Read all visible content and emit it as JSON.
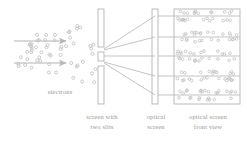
{
  "figure": {
    "background_color": "#ffffff",
    "stroke_color": "#b4b4b4",
    "dot_color": "#c2c2c2",
    "text_color": "#9a9a9a"
  },
  "labels": {
    "electrons": "electrons",
    "slit_screen_line1": "screen with",
    "slit_screen_line2": "two slits",
    "optical_screen_line1": "optical",
    "optical_screen_line2": "screen",
    "front_view_line1": "optical screen",
    "front_view_line2": "front view"
  },
  "beam": {
    "arrow_count": 2,
    "arrows": [
      {
        "x1": 14,
        "y1": 41,
        "x2": 66,
        "y2": 41
      },
      {
        "x1": 14,
        "y1": 63,
        "x2": 66,
        "y2": 63
      }
    ],
    "electron_dot_count": 58,
    "dot_radius": 1.5
  },
  "slit_screen": {
    "x": 98,
    "width": 6,
    "segments": [
      {
        "y": 9,
        "height": 38
      },
      {
        "y": 52,
        "height": 9
      },
      {
        "y": 66,
        "height": 38
      }
    ],
    "slit_gaps": [
      {
        "y": 47,
        "height": 5
      },
      {
        "y": 61,
        "height": 5
      }
    ]
  },
  "rays": {
    "count": 5,
    "origin_x": 104,
    "items": [
      {
        "origin_y": 49,
        "end_x": 155,
        "end_y": 16
      },
      {
        "origin_y": 50,
        "end_x": 155,
        "end_y": 37
      },
      {
        "origin_y": 56,
        "end_x": 155,
        "end_y": 56
      },
      {
        "origin_y": 62,
        "end_x": 155,
        "end_y": 76
      },
      {
        "origin_y": 63,
        "end_x": 155,
        "end_y": 95
      }
    ]
  },
  "optical_screen": {
    "x": 152,
    "y": 9,
    "width": 6,
    "height": 95
  },
  "front_view_panel": {
    "x": 174,
    "y": 9,
    "width": 66,
    "height": 95,
    "band_count": 5,
    "bands": [
      {
        "line_y": 16,
        "dots": 26
      },
      {
        "line_y": 37,
        "dots": 26
      },
      {
        "line_y": 56,
        "dots": 26
      },
      {
        "line_y": 76,
        "dots": 26
      },
      {
        "line_y": 95,
        "dots": 26
      }
    ],
    "connector_lines": [
      {
        "x1": 158,
        "y1": 16,
        "x2": 174,
        "y2": 16
      },
      {
        "x1": 158,
        "y1": 37,
        "x2": 174,
        "y2": 37
      },
      {
        "x1": 158,
        "y1": 56,
        "x2": 174,
        "y2": 56
      },
      {
        "x1": 158,
        "y1": 76,
        "x2": 174,
        "y2": 76
      },
      {
        "x1": 158,
        "y1": 95,
        "x2": 174,
        "y2": 95
      }
    ]
  }
}
